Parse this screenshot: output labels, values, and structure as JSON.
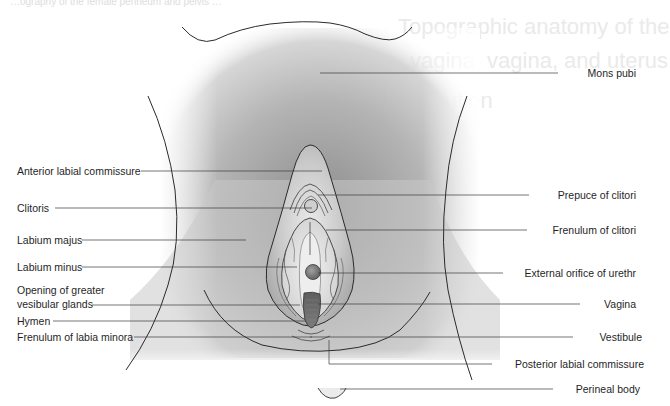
{
  "diagram": {
    "colors": {
      "outline": "#2b2b2b",
      "shading_dark": "#9a9a9a",
      "shading_light": "#f4f4f4",
      "label_text": "#1f1f1f",
      "leader_line": "#3a3a3a",
      "vagina_fill": "#6e6e6e"
    },
    "ghost_text": {
      "top_line": "…ography  of  the  female  perineum  and  pelvis  …",
      "line1": "Topographic anatomy of the",
      "line2": "vagina, vagina, and uterus",
      "line3": "ution"
    },
    "labels_left": [
      {
        "id": "anterior-labial-commissure",
        "text": "Anterior labial commissure"
      },
      {
        "id": "clitoris",
        "text": "Clitoris"
      },
      {
        "id": "labium-majus",
        "text": "Labium majus"
      },
      {
        "id": "labium-minus",
        "text": "Labium minus"
      },
      {
        "id": "opening-greater-vestibular-glands",
        "text": "Opening of greater",
        "text2": "vesibular glands"
      },
      {
        "id": "hymen",
        "text": "Hymen"
      },
      {
        "id": "frenulum-labia-minora",
        "text": "Frenulum of labia minora"
      }
    ],
    "labels_right": [
      {
        "id": "mons-pubis",
        "text": "Mons pubi"
      },
      {
        "id": "prepuce-clitoris",
        "text": "Prepuce of clitori"
      },
      {
        "id": "frenulum-clitoris",
        "text": "Frenulum of clitori"
      },
      {
        "id": "external-urethral-orifice",
        "text": "External orifice of urethr"
      },
      {
        "id": "vagina",
        "text": "Vagina"
      },
      {
        "id": "vestibule",
        "text": "Vestibule"
      },
      {
        "id": "posterior-labial-commissure",
        "text": "Posterior labial commissure"
      },
      {
        "id": "perineal-body",
        "text": "Perineal body"
      }
    ]
  }
}
